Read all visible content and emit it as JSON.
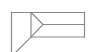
{
  "figure": {
    "stroke_color": "#8a8a8a",
    "background": "#ffffff",
    "stroke_width": 1.2
  }
}
